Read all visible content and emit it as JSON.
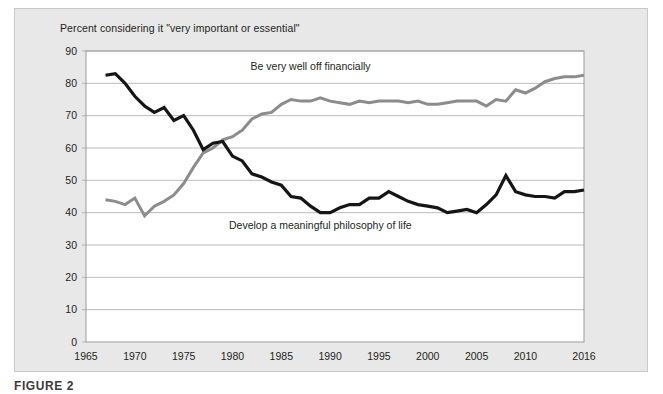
{
  "figure": {
    "caption": "FIGURE 2",
    "panel_background": "#e8e8e8",
    "plot_background": "#ffffff"
  },
  "chart_data": {
    "type": "line",
    "title": "Percent considering it \"very important or essential\"",
    "xlabel": "",
    "ylabel": "",
    "xlim": [
      1965,
      2016
    ],
    "ylim": [
      0,
      90
    ],
    "grid": true,
    "grid_axis": "y",
    "legend_position": "inline-annotation",
    "ytick_labels": [
      "0",
      "10",
      "20",
      "30",
      "40",
      "50",
      "60",
      "70",
      "80",
      "90"
    ],
    "yticks": [
      0,
      10,
      20,
      30,
      40,
      50,
      60,
      70,
      80,
      90
    ],
    "xtick_labels": [
      "1965",
      "1970",
      "1975",
      "1980",
      "1985",
      "1990",
      "1995",
      "2000",
      "2005",
      "2010",
      "2016"
    ],
    "xticks": [
      1965,
      1970,
      1975,
      1980,
      1985,
      1990,
      1995,
      2000,
      2005,
      2010,
      2016
    ],
    "x": [
      1967,
      1968,
      1969,
      1970,
      1971,
      1972,
      1973,
      1974,
      1975,
      1976,
      1977,
      1978,
      1979,
      1980,
      1981,
      1982,
      1983,
      1984,
      1985,
      1986,
      1987,
      1988,
      1989,
      1990,
      1991,
      1992,
      1993,
      1994,
      1995,
      1996,
      1997,
      1998,
      1999,
      2000,
      2001,
      2002,
      2003,
      2004,
      2005,
      2006,
      2007,
      2008,
      2009,
      2010,
      2011,
      2012,
      2013,
      2014,
      2015,
      2016
    ],
    "series": [
      {
        "name": "Be very well off financially",
        "color": "#8c8c8c",
        "label_x": 1988,
        "label_y": 84,
        "values": [
          44,
          43.5,
          42.5,
          44.5,
          39,
          42,
          43.5,
          45.5,
          49,
          54,
          58.5,
          60,
          62.5,
          63.5,
          65.5,
          69,
          70.5,
          71,
          73.5,
          75,
          74.5,
          74.5,
          75.5,
          74.5,
          74,
          73.5,
          74.5,
          74,
          74.5,
          74.5,
          74.5,
          74,
          74.5,
          73.5,
          73.5,
          74,
          74.5,
          74.5,
          74.5,
          73,
          75,
          74.5,
          78,
          77,
          78.5,
          80.5,
          81.5,
          82,
          82,
          82.5
        ]
      },
      {
        "name": "Develop a meaningful philosophy of life",
        "color": "#151515",
        "label_x": 1989,
        "label_y": 35,
        "values": [
          82.5,
          83,
          80,
          76,
          73,
          71,
          72.5,
          68.5,
          70,
          65.5,
          59.5,
          61.5,
          62,
          57.5,
          56,
          52,
          51,
          49.5,
          48.5,
          45,
          44.5,
          42,
          40,
          40,
          41.5,
          42.5,
          42.5,
          44.5,
          44.5,
          46.5,
          45,
          43.5,
          42.5,
          42,
          41.5,
          40,
          40.5,
          41,
          40,
          42.5,
          45.5,
          51.5,
          46.5,
          45.5,
          45,
          45,
          44.5,
          46.5,
          46.5,
          47
        ]
      }
    ]
  }
}
